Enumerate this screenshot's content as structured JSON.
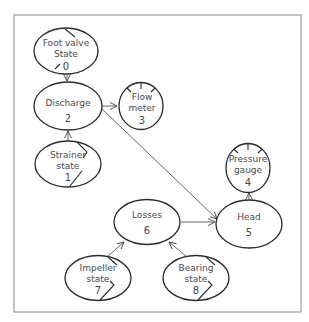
{
  "diagram": {
    "type": "causal-network",
    "frame": {
      "x": 14,
      "y": 15,
      "width": 287,
      "height": 297
    },
    "nodes": [
      {
        "id": 0,
        "line1": "Foot valve",
        "line2": "State",
        "number": "0",
        "shape": "ellipse",
        "marker": "state"
      },
      {
        "id": 1,
        "line1": "Strainer",
        "line2": "state",
        "number": "1",
        "shape": "ellipse",
        "marker": "state"
      },
      {
        "id": 2,
        "line1": "Discharge",
        "line2": "",
        "number": "2",
        "shape": "ellipse",
        "marker": "none"
      },
      {
        "id": 3,
        "line1": "Flow",
        "line2": "meter",
        "number": "3",
        "shape": "circle",
        "marker": "gauge"
      },
      {
        "id": 4,
        "line1": "Pressure",
        "line2": "gauge",
        "number": "4",
        "shape": "circle",
        "marker": "gauge"
      },
      {
        "id": 5,
        "line1": "Head",
        "line2": "",
        "number": "5",
        "shape": "ellipse",
        "marker": "none"
      },
      {
        "id": 6,
        "line1": "Losses",
        "line2": "",
        "number": "6",
        "shape": "ellipse",
        "marker": "none"
      },
      {
        "id": 7,
        "line1": "Impeller",
        "line2": "state",
        "number": "7",
        "shape": "ellipse",
        "marker": "state"
      },
      {
        "id": 8,
        "line1": "Bearing",
        "line2": "state",
        "number": "8",
        "shape": "ellipse",
        "marker": "state"
      }
    ],
    "edges": [
      {
        "from": 0,
        "to": 2
      },
      {
        "from": 1,
        "to": 2
      },
      {
        "from": 2,
        "to": 3
      },
      {
        "from": 2,
        "to": 5
      },
      {
        "from": 6,
        "to": 5
      },
      {
        "from": 5,
        "to": 4
      },
      {
        "from": 7,
        "to": 6
      },
      {
        "from": 8,
        "to": 6
      }
    ]
  }
}
